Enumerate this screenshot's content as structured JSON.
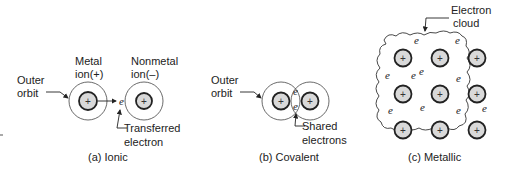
{
  "diagram": {
    "ionic": {
      "caption": "(a) Ionic",
      "labels": {
        "outer_orbit_line1": "Outer",
        "outer_orbit_line2": "orbit",
        "metal_line1": "Metal",
        "metal_line2": "ion(+)",
        "nonmetal_line1": "Nonmetal",
        "nonmetal_line2": "ion(–)",
        "transferred_line1": "Transferred",
        "transferred_line2": "electron"
      },
      "ions": [
        "+",
        "+"
      ],
      "electron": "e"
    },
    "covalent": {
      "caption": "(b) Covalent",
      "labels": {
        "outer_orbit_line1": "Outer",
        "outer_orbit_line2": "orbit",
        "shared_line1": "Shared",
        "shared_line2": "electrons"
      },
      "ions": [
        "+",
        "+"
      ],
      "electrons": [
        "e",
        "e"
      ]
    },
    "metallic": {
      "caption": "(c) Metallic",
      "labels": {
        "cloud_line1": "Electron",
        "cloud_line2": "cloud"
      },
      "ion_symbol": "+",
      "ion_grid": {
        "rows": 3,
        "cols": 3
      },
      "electron_symbol": "e",
      "electron_count": 10
    }
  }
}
